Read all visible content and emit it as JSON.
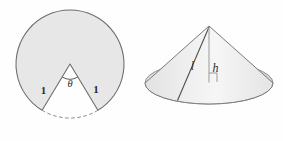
{
  "figure": {
    "background_color": "#fefefe",
    "left_figure": {
      "name": "circle-with-sector-removed",
      "fill_color": "#e7e7e7",
      "stroke_color": "#6e6e6e",
      "center": {
        "x": 70,
        "y": 64
      },
      "radius": 54,
      "labels": {
        "radius_left": "1",
        "radius_right": "1",
        "angle": "θ"
      },
      "dashed_arc": {
        "name": "dashed-arc",
        "style": "dashed",
        "color": "#8a8a8a"
      }
    },
    "right_figure": {
      "name": "cone",
      "fill_color": "#ececec",
      "base_fill_color": "#dedede",
      "stroke_color": "#7a7a7a",
      "apex": {
        "x": 209,
        "y": 26
      },
      "base_center": {
        "x": 209,
        "y": 83
      },
      "base_rx": 64,
      "base_ry": 21,
      "labels": {
        "slant_height": "l",
        "height": "h"
      },
      "right_angle_marker": {
        "name": "right-angle-marker",
        "present": true
      }
    }
  }
}
